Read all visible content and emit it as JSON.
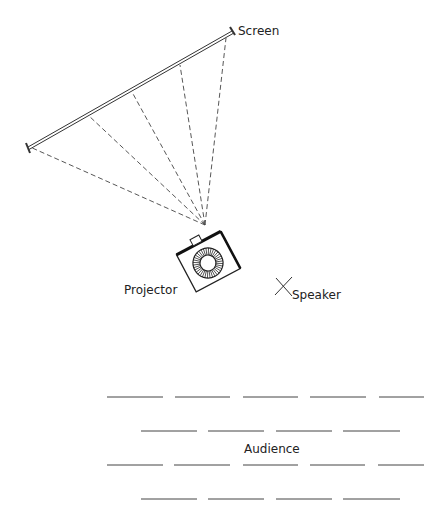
{
  "diagram": {
    "labels": {
      "screen": "Screen",
      "projector": "Projector",
      "speaker": "Speaker",
      "audience": "Audience"
    },
    "screen": {
      "x1": 28,
      "y1": 148,
      "x2": 232,
      "y2": 32
    },
    "projector_lens": {
      "x": 205,
      "y": 225
    },
    "rays_to_screen": [
      {
        "x": 30,
        "y": 147
      },
      {
        "x": 88,
        "y": 115
      },
      {
        "x": 132,
        "y": 92
      },
      {
        "x": 180,
        "y": 65
      },
      {
        "x": 226,
        "y": 38
      }
    ],
    "audience_rows": [
      {
        "y": 397,
        "segments": [
          [
            107,
            163
          ],
          [
            175,
            230
          ],
          [
            243,
            298
          ],
          [
            310,
            366
          ],
          [
            379,
            424
          ]
        ]
      },
      {
        "y": 431,
        "segments": [
          [
            141,
            197
          ],
          [
            208,
            264
          ],
          [
            276,
            332
          ],
          [
            343,
            400
          ]
        ]
      },
      {
        "y": 465,
        "segments": [
          [
            107,
            163
          ],
          [
            174,
            230
          ],
          [
            243,
            298
          ],
          [
            310,
            365
          ],
          [
            378,
            424
          ]
        ]
      },
      {
        "y": 499,
        "segments": [
          [
            141,
            197
          ],
          [
            208,
            264
          ],
          [
            276,
            332
          ],
          [
            343,
            400
          ]
        ]
      }
    ]
  }
}
